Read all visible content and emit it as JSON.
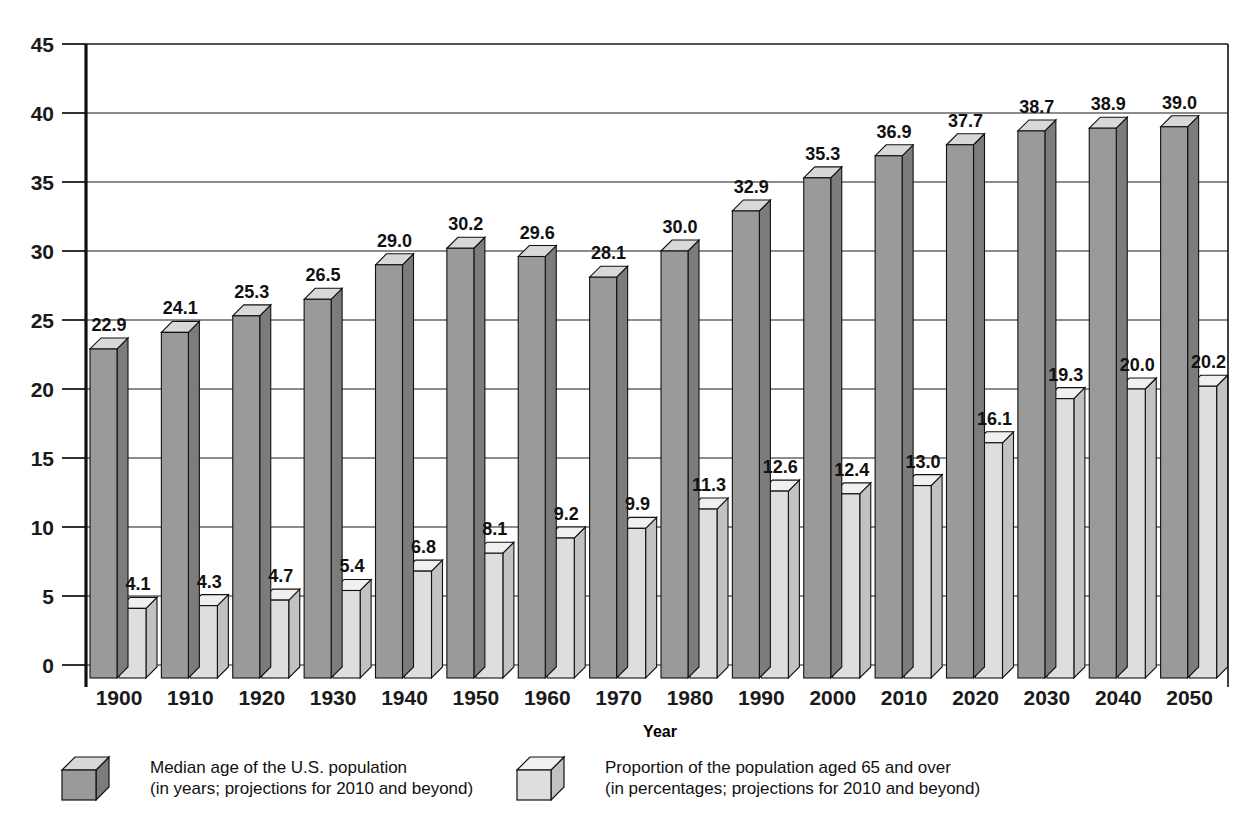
{
  "chart_data": {
    "type": "bar",
    "title": "",
    "xlabel": "Year",
    "ylabel": "",
    "ylim": [
      0,
      45
    ],
    "yticks": [
      0,
      5,
      10,
      15,
      20,
      25,
      30,
      35,
      40,
      45
    ],
    "ytick_labels": [
      "0",
      "5",
      "10",
      "15",
      "20",
      "25",
      "30",
      "35",
      "40",
      "45"
    ],
    "grid": true,
    "legend_position": "bottom",
    "categories": [
      "1900",
      "1910",
      "1920",
      "1930",
      "1940",
      "1950",
      "1960",
      "1970",
      "1980",
      "1990",
      "2000",
      "2010",
      "2020",
      "2030",
      "2040",
      "2050"
    ],
    "series": [
      {
        "name": "Median age of the U.S. population",
        "values": [
          22.9,
          24.1,
          25.3,
          26.5,
          29.0,
          30.2,
          29.6,
          28.1,
          30.0,
          32.9,
          35.3,
          36.9,
          37.7,
          38.7,
          38.9,
          39.0
        ],
        "value_labels": [
          "22.9",
          "24.1",
          "25.3",
          "26.5",
          "29.0",
          "30.2",
          "29.6",
          "28.1",
          "30.0",
          "32.9",
          "35.3",
          "36.9",
          "37.7",
          "38.7",
          "38.9",
          "39.0"
        ],
        "color_front": "#9a9a9a",
        "color_top": "#d8d8d8",
        "color_side": "#7c7c7c"
      },
      {
        "name": "Proportion of the population aged 65 and over",
        "values": [
          4.1,
          4.3,
          4.7,
          5.4,
          6.8,
          8.1,
          9.2,
          9.9,
          11.3,
          12.6,
          12.4,
          13.0,
          16.1,
          19.3,
          20.0,
          20.2
        ],
        "value_labels": [
          "4.1",
          "4.3",
          "4.7",
          "5.4",
          "6.8",
          "8.1",
          "9.2",
          "9.9",
          "11.3",
          "12.6",
          "12.4",
          "13.0",
          "16.1",
          "19.3",
          "20.0",
          "20.2"
        ],
        "color_front": "#dededc",
        "color_top": "#f0f0ee",
        "color_side": "#c2c2c0"
      }
    ]
  },
  "legend": {
    "items": [
      {
        "line1": "Median age of the U.S. population",
        "line2": "(in years; projections for 2010 and beyond)",
        "swatch": "dark"
      },
      {
        "line1": "Proportion of the population aged 65 and over",
        "line2": "(in percentages; projections for 2010 and beyond)",
        "swatch": "light"
      }
    ]
  }
}
